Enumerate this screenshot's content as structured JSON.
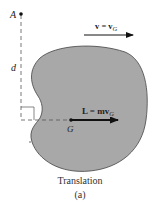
{
  "figure": {
    "point_label": "A",
    "distance_label": "d",
    "velocity_label": "v = v",
    "velocity_subscript": "G",
    "momentum_label": "L = mv",
    "momentum_subscript": "G",
    "center_label": "G",
    "caption": "Translation",
    "subcaption": "(a)"
  },
  "colors": {
    "body_fill": "#a8a8a8",
    "outline": "#333333",
    "arrow": "#111111",
    "dashed": "#555555"
  }
}
